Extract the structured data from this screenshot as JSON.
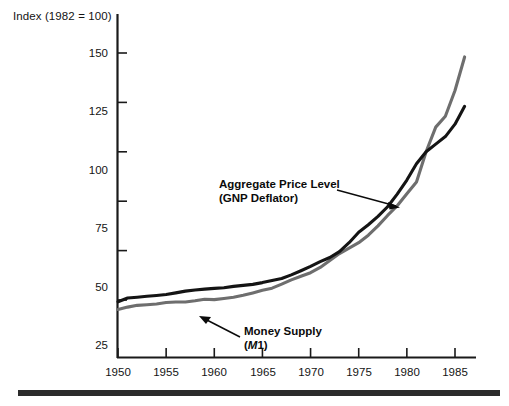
{
  "chart_data": {
    "type": "line",
    "title": "",
    "ylabel": "Index (1982 = 100)",
    "xlabel": "",
    "xlim": [
      1950,
      1986
    ],
    "ylim": [
      0,
      160
    ],
    "grid": false,
    "legend": "inline-annotations",
    "y_ticks": [
      25,
      50,
      75,
      100,
      125,
      150
    ],
    "y_tick_labels": [
      "25",
      "50",
      "75",
      "100",
      "125",
      "150"
    ],
    "x_ticks": [
      1950,
      1955,
      1960,
      1965,
      1970,
      1975,
      1980,
      1985
    ],
    "x_tick_labels": [
      "1950",
      "1955",
      "1960",
      "1965",
      "1970",
      "1975",
      "1980",
      "1985"
    ],
    "x": [
      1950,
      1951,
      1952,
      1953,
      1954,
      1955,
      1956,
      1957,
      1958,
      1959,
      1960,
      1961,
      1962,
      1963,
      1964,
      1965,
      1966,
      1967,
      1968,
      1969,
      1970,
      1971,
      1972,
      1973,
      1974,
      1975,
      1976,
      1977,
      1978,
      1979,
      1980,
      1981,
      1982,
      1983,
      1984,
      1985,
      1986
    ],
    "series": [
      {
        "name": "Aggregate Price Level (GNP Deflator)",
        "color": "#141414",
        "values": [
          24.1,
          26.0,
          26.4,
          26.9,
          27.3,
          27.8,
          28.6,
          29.5,
          30.1,
          30.5,
          30.9,
          31.2,
          31.9,
          32.4,
          32.9,
          33.8,
          34.9,
          35.9,
          37.7,
          39.8,
          42.0,
          44.4,
          46.5,
          49.5,
          54.0,
          59.3,
          63.1,
          67.3,
          72.2,
          78.6,
          85.7,
          94.0,
          100.0,
          103.9,
          107.7,
          114.0,
          123.0
        ]
      },
      {
        "name": "Money Supply (M1)",
        "color": "#6e6e6e",
        "values": [
          20.2,
          21.4,
          22.3,
          22.6,
          23.0,
          23.7,
          24.0,
          24.0,
          24.6,
          25.4,
          25.2,
          25.8,
          26.4,
          27.4,
          28.6,
          29.9,
          31.0,
          33.0,
          35.2,
          37.0,
          38.8,
          41.5,
          45.0,
          48.5,
          51.2,
          54.0,
          57.8,
          62.5,
          67.8,
          72.7,
          78.8,
          84.7,
          100.0,
          112.5,
          118.0,
          131.0,
          148.0
        ]
      }
    ],
    "annotations": [
      {
        "id": "price-annotation",
        "line1": "Aggregate Price Level",
        "line2": "(GNP Deflator)",
        "target_year": 1979,
        "target_value": 79
      },
      {
        "id": "money-annotation",
        "line1": "Money Supply",
        "line2_prefix": "(",
        "line2_italic": "M",
        "line2_suffix": "1)",
        "target_year": 1961,
        "target_value": 26
      }
    ]
  },
  "colors": {
    "price_level_line": "#141414",
    "money_supply_line": "#6e6e6e",
    "axis": "#1a1a1a",
    "bottom_rule": "#2b2b2b",
    "background": "#ffffff"
  }
}
